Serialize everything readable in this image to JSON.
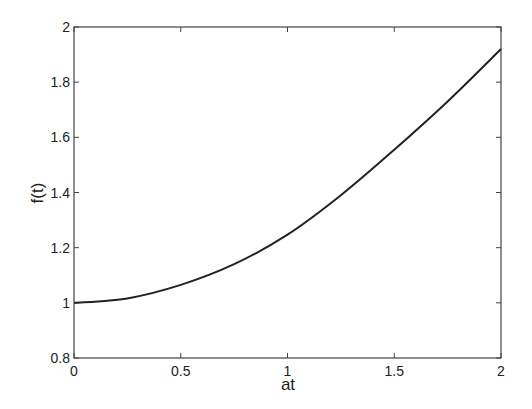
{
  "chart_data": {
    "type": "line",
    "title": "",
    "xlabel": "at",
    "ylabel": "f(t)",
    "xlim": [
      0,
      2
    ],
    "ylim": [
      0.8,
      2
    ],
    "grid": false,
    "legend": null,
    "xticks": [
      "0",
      "0.5",
      "1",
      "1.5",
      "2"
    ],
    "yticks": [
      "0.8",
      "1",
      "1.2",
      "1.4",
      "1.6",
      "1.8",
      "2"
    ],
    "series": [
      {
        "name": "f(t)",
        "x": [
          0,
          0.25,
          0.5,
          0.75,
          1.0,
          1.25,
          1.5,
          1.75,
          2.0
        ],
        "values": [
          1.0,
          1.016,
          1.065,
          1.14,
          1.247,
          1.39,
          1.555,
          1.73,
          1.92
        ]
      }
    ]
  }
}
